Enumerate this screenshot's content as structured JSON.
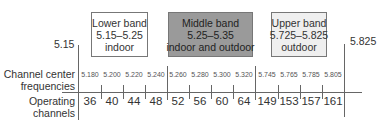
{
  "bands": [
    {
      "name": "Lower band",
      "range": "5.15–5.25",
      "use": "indoor",
      "fill": "#ffffff"
    },
    {
      "name": "Middle band",
      "range": "5.25–5.35",
      "use": "indoor and outdoor",
      "fill": "#9a9a9a"
    },
    {
      "name": "Upper band",
      "range": "5.725–5.825",
      "use": "outdoor",
      "fill": "#efefef"
    }
  ],
  "edges": {
    "left": "5.15",
    "right": "5.825"
  },
  "row_labels": {
    "frequencies_line1": "Channel center",
    "frequencies_line2": "frequencies",
    "channels_line1": "Operating",
    "channels_line2": "channels"
  },
  "frequencies": [
    "5.180",
    "5.200",
    "5.220",
    "5.240",
    "5.260",
    "5.280",
    "5.300",
    "5.320",
    "5.745",
    "5.765",
    "5.785",
    "5.805"
  ],
  "channels": [
    "36",
    "40",
    "44",
    "48",
    "52",
    "56",
    "60",
    "64",
    "149",
    "153",
    "157",
    "161"
  ]
}
